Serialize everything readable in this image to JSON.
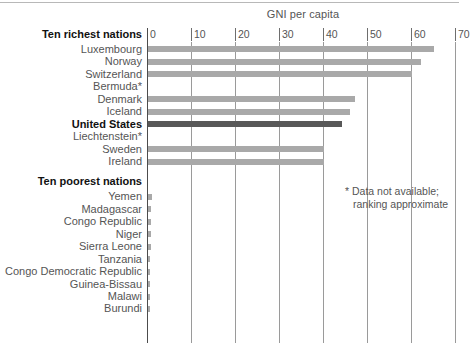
{
  "chart_data": {
    "type": "bar",
    "title": "GNI per capita",
    "xlabel": "",
    "ylabel": "",
    "orientation": "horizontal",
    "xlim": [
      0,
      70
    ],
    "xticks": [
      0,
      10,
      20,
      30,
      40,
      50,
      60,
      70
    ],
    "xtick_labels": [
      "0",
      "10",
      "20",
      "30",
      "40",
      "50",
      "60",
      "70"
    ],
    "grid": true,
    "legend": "none",
    "sections": [
      {
        "label": "Ten richest nations",
        "categories": [
          "Luxembourg",
          "Norway",
          "Switzerland",
          "Bermuda*",
          "Denmark",
          "Iceland",
          "United States",
          "Liechtenstein*",
          "Sweden",
          "Ireland"
        ],
        "values": [
          65,
          62,
          60,
          null,
          47,
          46,
          44,
          null,
          40,
          40
        ],
        "highlight_index": 6
      },
      {
        "label": "Ten poorest nations",
        "categories": [
          "Yemen",
          "Madagascar",
          "Congo Republic",
          "Niger",
          "Sierra Leone",
          "Tanzania",
          "Congo Democratic Republic",
          "Guinea-Bissau",
          "Malawi",
          "Burundi"
        ],
        "values": [
          0.8,
          0.75,
          0.7,
          0.65,
          0.6,
          0.55,
          0.5,
          0.45,
          0.4,
          0.35
        ],
        "highlight_index": -1
      }
    ],
    "annotations": [
      {
        "text_line1": "* Data not available;",
        "text_line2": "ranking approximate"
      }
    ],
    "colors": {
      "bar": "#a9a9a9",
      "bar_highlight": "#585858",
      "grid": "#9a9a9a",
      "axis": "#4c4c4c",
      "text": "#555555",
      "text_bold": "#111111"
    }
  }
}
